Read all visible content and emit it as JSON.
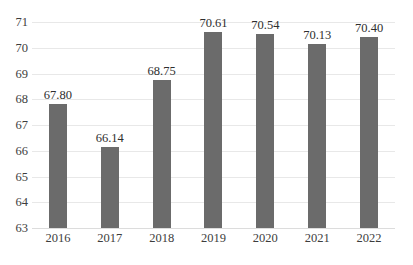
{
  "chart_data": {
    "type": "bar",
    "title": "",
    "subtitle": "",
    "xlabel": "",
    "ylabel": "",
    "categories": [
      "2016",
      "2017",
      "2018",
      "2019",
      "2020",
      "2021",
      "2022"
    ],
    "values": [
      67.8,
      66.14,
      68.75,
      70.61,
      70.54,
      70.13,
      70.4
    ],
    "data_labels": [
      "67.80",
      "66.14",
      "68.75",
      "70.61",
      "70.54",
      "70.13",
      "70.40"
    ],
    "ylim": [
      63,
      71
    ],
    "y_ticks": [
      63,
      64,
      65,
      66,
      67,
      68,
      69,
      70,
      71
    ],
    "y_tick_labels": [
      "63",
      "64",
      "65",
      "66",
      "67",
      "68",
      "69",
      "70",
      "71"
    ],
    "grid": "horizontal",
    "legend": "none",
    "series": [
      {
        "name": "",
        "values": [
          67.8,
          66.14,
          68.75,
          70.61,
          70.54,
          70.13,
          70.4
        ],
        "color": "#6B6B6B"
      }
    ],
    "colors": {
      "bar": "#6B6B6B",
      "gridline": "#E8E8E8",
      "axis_line": "#DCDCDC",
      "tick_text": "#3D3D3D",
      "label_text": "#2E2E2E",
      "background": "#FFFFFF"
    }
  }
}
